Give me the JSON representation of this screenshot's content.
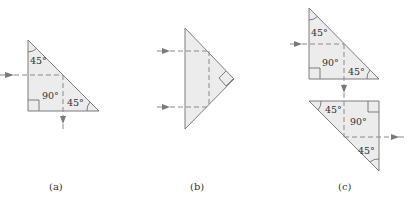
{
  "figure": {
    "panels": [
      {
        "id": "a",
        "caption": "(a)",
        "angles": {
          "top": "45°",
          "right_angle": "90°",
          "bottom_right": "45°"
        }
      },
      {
        "id": "b",
        "caption": "(b)"
      },
      {
        "id": "c",
        "caption": "(c)",
        "upper_prism": {
          "top": "45°",
          "right_angle": "90°",
          "bottom_right": "45°"
        },
        "lower_prism": {
          "top_left": "45°",
          "right_angle": "90°",
          "bottom_right": "45°"
        }
      }
    ],
    "colors": {
      "prism_fill": "#ececec",
      "prism_stroke": "#7d7d7d",
      "ray": "#8a8a8a",
      "arrow": "#7a7a7a"
    }
  }
}
